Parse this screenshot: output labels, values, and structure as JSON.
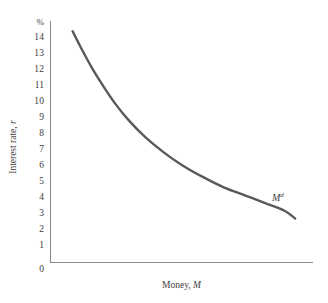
{
  "figure": {
    "background_color": "#ffffff",
    "axis_color": "#8c8c8c",
    "text_color": "#3d3d3d"
  },
  "axes": {
    "y_unit_label": "%",
    "y_title_text": "Interest rate, ",
    "y_title_symbol": "r",
    "x_title_text": "Money, ",
    "x_title_symbol": "M",
    "y_ticks": [
      "14",
      "13",
      "12",
      "11",
      "10",
      "9",
      "8",
      "7",
      "6",
      "5",
      "4",
      "3",
      "2",
      "1"
    ],
    "y_zero_label": "0"
  },
  "curve": {
    "label_base": "M",
    "label_sup": "d",
    "color": "#595959",
    "width_px": 2.4
  },
  "chart_data": {
    "type": "line",
    "title": "",
    "xlabel": "Money, M",
    "ylabel": "Interest rate, r",
    "yunit": "%",
    "ylim": [
      0,
      14.9
    ],
    "xlim": [
      0,
      100
    ],
    "grid": false,
    "legend": null,
    "yticks": [
      1,
      2,
      3,
      4,
      5,
      6,
      7,
      8,
      9,
      10,
      11,
      12,
      13,
      14
    ],
    "xticks": [],
    "annotations": [
      {
        "text": "M^d",
        "x": 88,
        "y": 3.8
      }
    ],
    "series": [
      {
        "name": "M^d",
        "color": "#595959",
        "x": [
          8.4,
          12,
          16,
          20,
          25,
          30,
          36,
          43,
          50,
          58,
          66,
          74,
          82,
          89,
          93.2
        ],
        "y": [
          14.45,
          13.3,
          12.1,
          11.05,
          9.85,
          8.85,
          7.85,
          6.9,
          6.1,
          5.35,
          4.7,
          4.2,
          3.7,
          3.25,
          2.75
        ]
      }
    ]
  }
}
